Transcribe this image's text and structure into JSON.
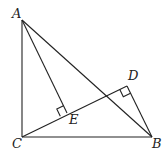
{
  "diagram": {
    "type": "geometry",
    "points": {
      "A": {
        "label": "A",
        "x": 22,
        "y": 20
      },
      "B": {
        "label": "B",
        "x": 152,
        "y": 137
      },
      "C": {
        "label": "C",
        "x": 22,
        "y": 137
      },
      "D": {
        "label": "D",
        "x": 127,
        "y": 86
      },
      "E": {
        "label": "E",
        "x": 67,
        "y": 113
      }
    },
    "segments": [
      "AC",
      "CB",
      "AB",
      "CD",
      "AE",
      "BD"
    ],
    "right_angles": [
      "AEC",
      "BDC"
    ],
    "labels": {
      "A": "A",
      "B": "B",
      "C": "C",
      "D": "D",
      "E": "E"
    }
  }
}
